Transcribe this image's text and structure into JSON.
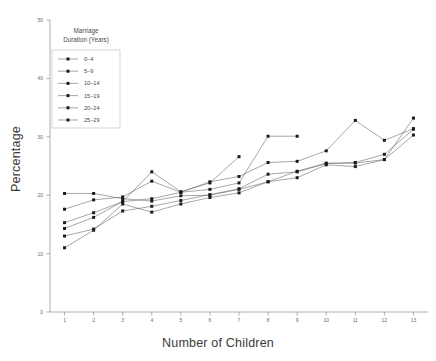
{
  "chart_data": {
    "type": "line",
    "title": "",
    "xlabel": "Number of Children",
    "ylabel": "Percentage",
    "x": [
      1,
      2,
      3,
      4,
      5,
      6,
      7,
      8,
      9,
      10,
      11,
      12,
      13
    ],
    "xlim": [
      0.5,
      13.5
    ],
    "ylim": [
      0,
      50
    ],
    "yticks": [
      0,
      10,
      20,
      30,
      40,
      50
    ],
    "xticks": [
      1,
      2,
      3,
      4,
      5,
      6,
      7,
      8,
      9,
      10,
      11,
      12,
      13
    ],
    "grid": false,
    "legend_position": "upper-left",
    "legend_title": "Marriage\nDuration (Years)",
    "legend_title_line1": "Marriage",
    "legend_title_line2": "Duration (Years)",
    "series": [
      {
        "name": "0–4",
        "x": [
          1,
          2,
          3,
          4,
          5,
          6,
          7,
          8,
          9,
          10,
          11,
          12,
          13
        ],
        "values": [
          20.3,
          20.3,
          19.4,
          19.0,
          19.9,
          20.0,
          21.0,
          22.3,
          23.0,
          25.2,
          24.9,
          26.1,
          33.2
        ]
      },
      {
        "name": "5–9",
        "x": [
          1,
          2,
          3,
          4,
          5,
          6,
          7,
          8,
          9,
          10,
          11,
          12,
          13
        ],
        "values": [
          17.6,
          19.2,
          19.7,
          22.4,
          20.5,
          22.3,
          23.2,
          25.6,
          25.8,
          27.6,
          32.8,
          29.4,
          31.4
        ]
      },
      {
        "name": "10–14",
        "x": [
          1,
          2,
          3,
          4,
          5,
          6,
          7
        ],
        "values": [
          15.3,
          17.0,
          18.9,
          24.0,
          20.6,
          22.1,
          26.6
        ]
      },
      {
        "name": "15–19",
        "x": [
          1,
          2,
          3,
          4,
          5,
          6,
          7,
          8,
          9
        ],
        "values": [
          14.3,
          16.2,
          18.9,
          19.4,
          20.5,
          21.0,
          22.1,
          30.1,
          30.1
        ]
      },
      {
        "name": "20–24",
        "x": [
          1,
          2,
          3,
          4,
          5,
          6,
          7,
          8,
          9,
          10,
          11,
          12,
          13
        ],
        "values": [
          13.0,
          14.2,
          17.3,
          18.1,
          19.1,
          20.1,
          21.1,
          23.6,
          24.0,
          25.4,
          25.6,
          27.0,
          31.3
        ]
      },
      {
        "name": "25–29",
        "x": [
          1,
          2,
          3,
          4,
          5,
          6,
          7,
          8,
          9,
          10,
          11,
          12,
          13
        ],
        "values": [
          11.0,
          14.0,
          18.5,
          17.1,
          18.5,
          19.6,
          20.4,
          22.3,
          24.1,
          25.5,
          25.5,
          26.1,
          30.3
        ]
      }
    ]
  },
  "figure": {
    "background_color": "#ffffff",
    "line_color": "#5d5d5d",
    "marker_color": "#1c1c1c",
    "axis_color": "#8d8d8d"
  }
}
